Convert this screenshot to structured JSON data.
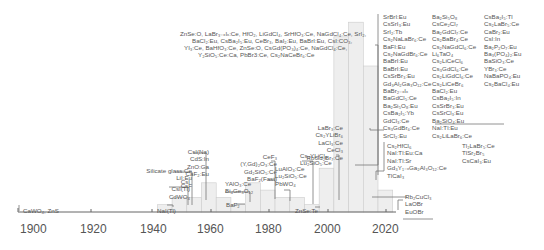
{
  "chart_data": {
    "type": "bar",
    "title": "",
    "xlabel": "",
    "ylabel": "",
    "grid": false,
    "xticks": [
      "1900",
      "1920",
      "1940",
      "1960",
      "1980",
      "2000",
      "2020"
    ],
    "xlim": [
      1895,
      2028
    ],
    "bins": [
      {
        "start": 1945,
        "end": 1950,
        "value": 1
      },
      {
        "start": 1950,
        "end": 1955,
        "value": 2
      },
      {
        "start": 1955,
        "end": 1960,
        "value": 2
      },
      {
        "start": 1960,
        "end": 1965,
        "value": 4
      },
      {
        "start": 1965,
        "end": 1970,
        "value": 2
      },
      {
        "start": 1970,
        "end": 1975,
        "value": 1
      },
      {
        "start": 1975,
        "end": 1980,
        "value": 4
      },
      {
        "start": 1980,
        "end": 1985,
        "value": 3
      },
      {
        "start": 1985,
        "end": 1990,
        "value": 2
      },
      {
        "start": 1990,
        "end": 1995,
        "value": 2
      },
      {
        "start": 1995,
        "end": 2000,
        "value": 1
      },
      {
        "start": 2000,
        "end": 2005,
        "value": 6
      },
      {
        "start": 2005,
        "end": 2010,
        "value": 24
      },
      {
        "start": 2010,
        "end": 2015,
        "value": 26
      },
      {
        "start": 2015,
        "end": 2020,
        "value": 20
      },
      {
        "start": 2020,
        "end": 2025,
        "value": 3
      }
    ],
    "bar_color": "#eeeeee",
    "bar_edge": "#cccccc",
    "annotations": [
      {
        "year": 1896,
        "text": "CaWO4, ZnS"
      },
      {
        "year": 1948,
        "text": "NaI(Tl)"
      },
      {
        "year": 1951,
        "text": "CsI\nCsI(Tl)\nCdWO4"
      },
      {
        "year": 1958,
        "text": "Silicate glass:Ce\nLiI:Eu\nCsF"
      },
      {
        "year": 1961,
        "text": "CsI(Na)\nCdS:In\nZnO:Ga\nCaF2:Eu"
      },
      {
        "year": 1971,
        "text": "BaF2"
      },
      {
        "year": 1973,
        "text": "YAlO3:Ce\nBi4Ge3O12"
      },
      {
        "year": 1982,
        "text": "CeF3\n(Y,Gd)2O3:Ce\nGd2SiO5:Ce\nBaF2(Fast)"
      },
      {
        "year": 1985,
        "text": "LuAlO3:Ce\nLu2SiO5:Ce\nPbWO4"
      },
      {
        "year": 1996,
        "text": "ZnSe:Te"
      },
      {
        "year": 1992,
        "text": "Cs3YLiCl6\nLu2SiO5:Ce"
      },
      {
        "year": 1999,
        "text": "LaBr3:Ce\nCs2YLiBr6\nLaCl3:Ce\nCeCl3\nRbGd2Br7:Ce"
      },
      {
        "year": 2002,
        "text": "ZnSe:O, LaBr3-xIx:Ce, HfO2, LiGdCl4, SrHfO3:Ce, NaGdCl4:Ce, SrI2, BaCl2:Eu, CsBa2I5:Eu, CeBr3, BaI2:Eu, BaBrI:Eu, CsI:CO3, YI3:Ce, BaHfO3:Ce, ZnSe:O, CsGd(PO3)4:Ce, NaGdCl4:Ce, Y2SiO5:Ce:Ca, PbBr3:Ce, Cs2NaCeBr6:Ce"
      },
      {
        "year": 2012,
        "text": "SrBrI:Eu, CsSrI3:Eu, SrI2:Tb, Cs2NaLaBr6:Ce, BaFI:Eu, Cs2NaGdBr6:Ce, BaBrI:Eu, BaBrI:Eu, CsSrBr3:Eu, Gd3Al2Ga3O12:Ce, BaBr2-xIx, BaGdCl5:Ce, Ba2Si5O12:Eu, CsBa2I5:Yb, GdCl3:Ce, Cs3GdBr6:Ce, SrCl2:Eu, Ba2Si5O8, CsCe2Cl7, Ba2GdCl7:Ce, Cs2BaBr4:Ce, Cs2NaGdCl6:Ce, Li6TaO4, Cs2LiCeCl6, Cs3GdCl6:Ce, Cs2LiGdCl6:Ce, Cs2LiCeBr6, BaCl2:Eu, CsBa2I5:In, CsSrBr3:Eu, CsSrCl3:Eu, Ba2SiO4:Eu, NaI:Tl:Eu, Cs2LiLaBr6:Ce, CsBa2I5:Tl, Cs2LaBr5:Ce, CaBr2:Eu, CsI:In, Ba2P2O7:Eu, Ba3(PO4)2:Eu, BaSiO3:Ce, YBr3:Ce, NaBaPO4:Eu, Cs2BaCl4:Eu"
      },
      {
        "year": 2017,
        "text": "Cs2HfCl6, NaI:Tl:Eu:Ca, NaI:Tl:Sr, Gd2Y1-xGa2Al3O12:Ce, TlCaI3, Tl2LaBr5:Ce, TlSr2Br5, CsCaI3:Eu"
      },
      {
        "year": 2021,
        "text": "Rb2CuCl3, LaOBr, EuOBr"
      }
    ]
  },
  "axis": {
    "ticks": [
      {
        "label": "1900",
        "x": 28
      },
      {
        "label": "1920",
        "x": 89
      },
      {
        "label": "1940",
        "x": 148
      },
      {
        "label": "1960",
        "x": 206
      },
      {
        "label": "1980",
        "x": 264
      },
      {
        "label": "2000",
        "x": 323
      },
      {
        "label": "2020",
        "x": 381
      }
    ]
  },
  "labels": {
    "cawo4": "CaWO₄, ZnS",
    "nai": "NaI(Tl)",
    "csi": "CsI\nCsI(Tl)\nCdWO₄",
    "silicate": "Silicate glass:Ce\nLiI:Eu\nCsF",
    "csina": "CsI(Na)\nCdS:In\nZnO:Ga\nCaF₂:Eu",
    "yalo": "YAlO₃:Ce\nBi₄Ge₃O₁₂",
    "baf2": "BaF₂",
    "cef3": "CeF₃\n(Y,Gd)₂O₃:Ce\nGd₂SiO₅:Ce\nBaF₂(Fast)",
    "lualo": "LuAlO₃:Ce\nLu₂SiO₅:Ce\nPbWO₄",
    "znsete": "ZnSe:Te",
    "csyli": "Cs₃YLiCl₆\nLu₂SiO₅:Ce",
    "labr": "LaBr₃:Ce\nCs₂YLiBr₆\nLaCl₃:Ce\nCeCl₃\nRbGd₂Br₇:Ce",
    "znse_line1": "ZnSe:O, LaBr₃₋ₓIₓ:Ce, HfO₂, LiGdCl₄, SrHfO₃:Ce, NaGdCl₄:Ce, SrI₂,",
    "znse_line2": "BaCl₂:Eu, CsBa₂I₅:Eu, CeBr₃, BaI₂:Eu, BaBrI:Eu, CsI:CO₃,",
    "znse_line3": "YI₃:Ce, BaHfO₃:Ce, ZnSe:O, CsGd(PO₃)₄:Ce, NaGdCl₄:Ce,",
    "znse_line4": "Y₂SiO₅:Ce:Ca, PbBr3:Ce, Cs₂NaCeBr₆:Ce",
    "col1": "SrBrI:Eu\nCsSrI₃:Eu\nSrI₂:Tb\nCs₂NaLaBr₆:Ce\nBaFI:Eu\nCs₂NaGdBr₆:Ce\nBaBrI:Eu\nBaBrI:Eu\nCsSrBr₃:Eu\nGd₃Al₂Ga₃O₁₂:Ce\nBaBr₂₋ₓIₓ\nBaGdCl₅:Ce\nBa₂Si₅O₈:Eu\nCsBa₂I₅:Yb\nGdCl₃:Ce\nCs₃GdBr₆:Ce\nSrCl₂:Eu",
    "col2": "Ba₂Si₅O₈\nCsCe₂Cl₇\nBa₂GdCl₇:Ce\nCs₂BaBr₄:Ce\nCs₂NaGdCl₆:Ce\nLi₆TaO₄\nCs₂LiCeCl₆\nCs₃GdCl₆:Ce\nCs₂LiGdCl₆:Ce\nCs₂LiCeBr₆\nBaCl₂:Eu\nCsBa₂I₅:In\nCsSrBr₃:Eu\nCsSrCl₃:Eu\nBa₂SiO₄:Eu\nNaI:Tl:Eu\nCs₂LiLaBr₆:Ce",
    "col3": "CsBa₂I₅:Tl\nCs₂LaBr₅:Ce\nCaBr₂:Eu\nCsI:In\nBa₂P₂O₇:Eu\nBa₃(PO₄)₂:Eu\nBaSiO₃:Ce\nYBr₃:Ce\nNaBaPO₄:Eu\nCs₂BaCl₄:Eu",
    "hf1": "Cs₂HfCl₆\nNaI:Tl:Eu:Ca\nNaI:Tl:Sr\nGd₃Y₁₋ₓGa₂Al₃O₁₂:Ce\nTlCaI₃",
    "hf2": "Tl₂LaBr₅:Ce\nTlSr₂Br₅\nCsCaI₃:Eu",
    "rb": "Rb₂CuCl₃\nLaOBr\nEuOBr"
  }
}
